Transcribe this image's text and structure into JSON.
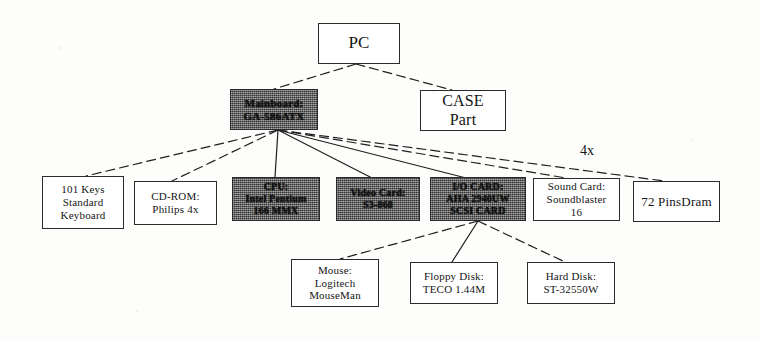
{
  "diagram": {
    "colors": {
      "page_background": "#fdfdfb",
      "box_border": "#2b2b2b",
      "box_fill": "#ffffff",
      "shaded_box_fill": "#6d6d6d",
      "line": "#1f1f1f",
      "text": "#151515"
    },
    "nodes": [
      {
        "id": "pc",
        "name": "pc",
        "lines": [
          "PC"
        ],
        "shaded": false,
        "x": 318,
        "y": 23,
        "w": 82,
        "h": 41,
        "font_size": 17
      },
      {
        "id": "mainboard",
        "name": "mainboard",
        "lines": [
          "Mainboard:",
          "GA-586ATX"
        ],
        "shaded": true,
        "x": 230,
        "y": 89,
        "w": 88,
        "h": 41,
        "font_size": 11
      },
      {
        "id": "case",
        "name": "case-part",
        "lines": [
          "CASE",
          "Part"
        ],
        "shaded": false,
        "x": 420,
        "y": 90,
        "w": 86,
        "h": 41,
        "font_size": 16
      },
      {
        "id": "keyboard",
        "name": "keyboard",
        "lines": [
          "101 Keys",
          "Standard",
          "Keyboard"
        ],
        "shaded": false,
        "x": 42,
        "y": 176,
        "w": 82,
        "h": 53,
        "font_size": 11
      },
      {
        "id": "cdrom",
        "name": "cd-rom",
        "lines": [
          "CD-ROM:",
          "Philips 4x"
        ],
        "shaded": false,
        "x": 134,
        "y": 181,
        "w": 83,
        "h": 44,
        "font_size": 11
      },
      {
        "id": "cpu",
        "name": "cpu",
        "lines": [
          "CPU:",
          "Intel Pentium",
          "166 MMX"
        ],
        "shaded": true,
        "x": 232,
        "y": 177,
        "w": 88,
        "h": 44,
        "font_size": 10
      },
      {
        "id": "videocard",
        "name": "video-card",
        "lines": [
          "Video Card:",
          "S3-868"
        ],
        "shaded": true,
        "x": 336,
        "y": 177,
        "w": 84,
        "h": 44,
        "font_size": 10
      },
      {
        "id": "iocard",
        "name": "io-card",
        "lines": [
          "I/O CARD:",
          "AHA 2940UW",
          "SCSI CARD"
        ],
        "shaded": true,
        "x": 430,
        "y": 177,
        "w": 96,
        "h": 44,
        "font_size": 10
      },
      {
        "id": "soundcard",
        "name": "sound-card",
        "lines": [
          "Sound Card:",
          "Soundblaster",
          "16"
        ],
        "shaded": false,
        "x": 533,
        "y": 178,
        "w": 87,
        "h": 43,
        "font_size": 11
      },
      {
        "id": "dram",
        "name": "dram",
        "lines": [
          "72 PinsDram"
        ],
        "shaded": false,
        "x": 633,
        "y": 181,
        "w": 87,
        "h": 41,
        "font_size": 13
      },
      {
        "id": "mouse",
        "name": "mouse",
        "lines": [
          "Mouse:",
          "Logitech",
          "MouseMan"
        ],
        "shaded": false,
        "x": 291,
        "y": 259,
        "w": 88,
        "h": 48,
        "font_size": 11
      },
      {
        "id": "floppy",
        "name": "floppy-disk",
        "lines": [
          "Floppy Disk:",
          "TECO 1.44M"
        ],
        "shaded": false,
        "x": 410,
        "y": 262,
        "w": 88,
        "h": 42,
        "font_size": 11
      },
      {
        "id": "harddisk",
        "name": "hard-disk",
        "lines": [
          "Hard Disk:",
          "ST-32550W"
        ],
        "shaded": false,
        "x": 527,
        "y": 262,
        "w": 88,
        "h": 42,
        "font_size": 11
      }
    ],
    "edges": [
      {
        "name": "edge-pc-mainboard",
        "from": "pc",
        "to": "mainboard",
        "style": "dashed",
        "x1": 356,
        "y1": 64,
        "x2": 274,
        "y2": 89
      },
      {
        "name": "edge-pc-case",
        "from": "pc",
        "to": "case",
        "style": "dashed",
        "x1": 356,
        "y1": 64,
        "x2": 452,
        "y2": 90
      },
      {
        "name": "edge-mainboard-keyboard",
        "from": "mainboard",
        "to": "keyboard",
        "style": "dashed",
        "x1": 278,
        "y1": 130,
        "x2": 86,
        "y2": 176
      },
      {
        "name": "edge-mainboard-cdrom",
        "from": "mainboard",
        "to": "cdrom",
        "style": "dashed",
        "x1": 278,
        "y1": 130,
        "x2": 172,
        "y2": 181
      },
      {
        "name": "edge-mainboard-cpu",
        "from": "mainboard",
        "to": "cpu",
        "style": "solid",
        "x1": 278,
        "y1": 130,
        "x2": 275,
        "y2": 177
      },
      {
        "name": "edge-mainboard-videocard",
        "from": "mainboard",
        "to": "videocard",
        "style": "solid",
        "x1": 278,
        "y1": 130,
        "x2": 374,
        "y2": 179
      },
      {
        "name": "edge-mainboard-iocard",
        "from": "mainboard",
        "to": "iocard",
        "style": "solid",
        "x1": 278,
        "y1": 130,
        "x2": 470,
        "y2": 179
      },
      {
        "name": "edge-mainboard-soundcard",
        "from": "mainboard",
        "to": "soundcard",
        "style": "dashed",
        "x1": 278,
        "y1": 130,
        "x2": 566,
        "y2": 178
      },
      {
        "name": "edge-mainboard-dram",
        "from": "mainboard",
        "to": "dram",
        "style": "dashed",
        "x1": 278,
        "y1": 130,
        "x2": 664,
        "y2": 181,
        "label": "4x"
      },
      {
        "name": "edge-iocard-mouse",
        "from": "iocard",
        "to": "mouse",
        "style": "dashed",
        "x1": 478,
        "y1": 221,
        "x2": 340,
        "y2": 259
      },
      {
        "name": "edge-iocard-floppy",
        "from": "iocard",
        "to": "floppy",
        "style": "solid",
        "x1": 478,
        "y1": 221,
        "x2": 452,
        "y2": 262
      },
      {
        "name": "edge-iocard-harddisk",
        "from": "iocard",
        "to": "harddisk",
        "style": "dashed",
        "x1": 478,
        "y1": 221,
        "x2": 565,
        "y2": 262
      }
    ],
    "edge_labels": [
      {
        "name": "edge-label-4x",
        "text": "4x",
        "x": 580,
        "y": 143,
        "font_size": 14
      }
    ]
  }
}
